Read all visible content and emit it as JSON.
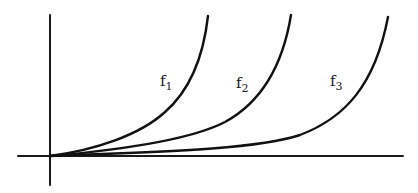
{
  "diagram": {
    "axes": {
      "x_axis": {
        "x1": 18,
        "x2": 403,
        "y": 156
      },
      "y_axis": {
        "x": 50,
        "y1": 15,
        "y2": 185
      }
    },
    "curves": [
      {
        "name": "f1",
        "label": "f",
        "subscript": "1",
        "path": "M50,156 C95,150 140,135 165,112 C188,92 203,60 208,16",
        "label_pos": {
          "x": 160,
          "y": 86
        }
      },
      {
        "name": "f2",
        "label": "f",
        "subscript": "2",
        "path": "M50,156 C120,150 190,140 225,122 C258,104 282,70 291,15",
        "label_pos": {
          "x": 236,
          "y": 88
        }
      },
      {
        "name": "f3",
        "label": "f",
        "subscript": "3",
        "path": "M50,156 C150,152 255,150 300,135 C345,118 375,85 388,17",
        "label_pos": {
          "x": 330,
          "y": 86
        }
      }
    ]
  }
}
